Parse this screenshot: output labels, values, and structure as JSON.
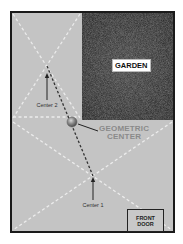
{
  "diagram": {
    "colors": {
      "background": "#ffffff",
      "floor": "#c4c4c4",
      "garden": "#2b2b2b",
      "border": "#1a1a1a",
      "diagonal_dashes": "#e8e8e8",
      "center_link_dashes": "#333333",
      "geo_center_ball": "#8c8c8c",
      "geo_label": "#8a8a8a"
    },
    "regions": {
      "garden": {
        "label": "GARDEN"
      },
      "front_door": {
        "line1": "FRONT",
        "line2": "DOOR"
      }
    },
    "annotations": {
      "center_1": "Center 1",
      "center_2": "Center 2",
      "geometric_center_line1": "GEOMETRIC",
      "geometric_center_line2": "CENTER"
    }
  }
}
